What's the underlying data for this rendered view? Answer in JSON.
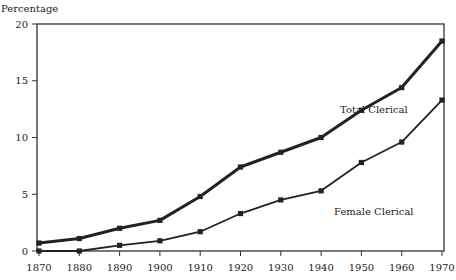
{
  "chart_data": {
    "type": "line",
    "title": "",
    "xlabel": "",
    "ylabel": "Percentage",
    "x": [
      1870,
      1880,
      1890,
      1900,
      1910,
      1920,
      1930,
      1940,
      1950,
      1960,
      1970
    ],
    "ylim": [
      0,
      20
    ],
    "yticks": [
      0,
      5,
      10,
      15,
      20
    ],
    "grid": false,
    "legend_position": "inline labels",
    "series": [
      {
        "name": "Total Clerical",
        "values": [
          0.7,
          1.1,
          2.0,
          2.7,
          4.8,
          7.4,
          8.7,
          10.0,
          12.4,
          14.4,
          18.5
        ],
        "line_width": 3,
        "label_pos": [
          340,
          113
        ]
      },
      {
        "name": "Female Clerical",
        "values": [
          0.0,
          0.0,
          0.5,
          0.9,
          1.7,
          3.3,
          4.5,
          5.3,
          7.8,
          9.6,
          13.3
        ],
        "line_width": 1.8,
        "label_pos": [
          334,
          215
        ]
      }
    ]
  },
  "colors": {
    "line": "#222222",
    "axis": "#333333",
    "background": "#ffffff"
  }
}
